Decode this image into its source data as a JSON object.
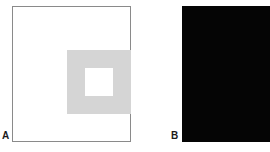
{
  "figure": {
    "width": 270,
    "height": 152,
    "background_color": "#ffffff",
    "type": "simultaneous-contrast-illusion"
  },
  "panels": [
    {
      "id": "A",
      "label": "A",
      "background_color": "#ffffff",
      "border_color": "#8a8a8a",
      "surround_square": {
        "name": "gray-surround-square",
        "color": "#d5d5d5",
        "size_px": 64
      },
      "center_square": {
        "name": "white-center-square",
        "color": "#ffffff",
        "size_px": 28
      }
    },
    {
      "id": "B",
      "label": "B",
      "background_color": "#050505",
      "border_color": "#050505",
      "surround_square": {
        "name": "gray-surround-square",
        "color": "#c9c9c9",
        "size_px": 64
      },
      "center_square": {
        "name": "black-center-square",
        "color": "#050505",
        "size_px": 28
      }
    }
  ]
}
